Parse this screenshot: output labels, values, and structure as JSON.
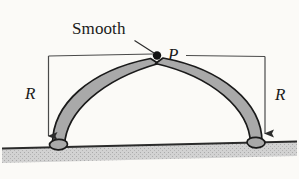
{
  "figure": {
    "background_color": "#fbfaf7",
    "ink_color": "#1a1a1a",
    "rod_fill_color": "#a9a9a9",
    "ground_band_color": "#cfcfcf"
  },
  "labels": {
    "smooth": "Smooth",
    "point_p": "P",
    "radius_left": "R",
    "radius_right": "R"
  },
  "geometry": {
    "apex_x": 157,
    "apex_y": 55,
    "left_base_x": 48,
    "right_base_x": 265,
    "ground_y": 146,
    "radius_px": 91
  },
  "annotations": [
    {
      "name": "leader-line",
      "from": "Smooth",
      "to": "P"
    },
    {
      "name": "dimension-left",
      "value": "R",
      "direction": "down"
    },
    {
      "name": "dimension-right",
      "value": "R",
      "direction": "down"
    }
  ]
}
